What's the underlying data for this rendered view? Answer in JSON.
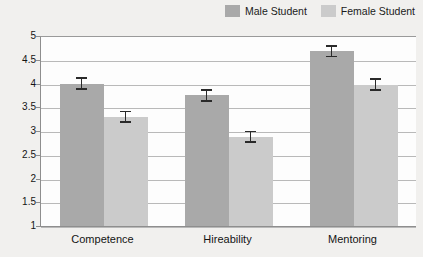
{
  "legend": {
    "position": "top-right",
    "entries": [
      {
        "label": "Male Student",
        "color": "#a9a9a9",
        "swatch_name": "legend-swatch-male"
      },
      {
        "label": "Female Student",
        "color": "#cbcbcb",
        "swatch_name": "legend-swatch-female"
      }
    ]
  },
  "colors": {
    "male_bar": "#a9a9a9",
    "female_bar": "#cbcbcb",
    "gridline": "#b9b9b9",
    "axis": "#8e8e8e",
    "error_bar": "#2a2a2a",
    "page_background": "#f1f0ee",
    "plot_background": "#fdfdfd"
  },
  "axis": {
    "y_ticks": [
      "5",
      "4.5",
      "4",
      "3.5",
      "3",
      "2.5",
      "2",
      "1.5",
      "1"
    ],
    "y_tick_values": [
      5,
      4.5,
      4,
      3.5,
      3,
      2.5,
      2,
      1.5,
      1
    ]
  },
  "chart_data": {
    "type": "bar",
    "title": "",
    "subtitle": "",
    "xlabel": "",
    "ylabel": "",
    "ylim": [
      1,
      5
    ],
    "ytick_step": 0.5,
    "grid": true,
    "legend_position": "top-right",
    "categories": [
      "Competence",
      "Hireability",
      "Mentoring"
    ],
    "series": [
      {
        "name": "Male Student",
        "color": "#a9a9a9",
        "values": [
          4.02,
          3.77,
          4.7
        ],
        "errors": [
          0.13,
          0.13,
          0.13
        ]
      },
      {
        "name": "Female Student",
        "color": "#cbcbcb",
        "values": [
          3.32,
          2.9,
          4.0
        ],
        "errors": [
          0.13,
          0.13,
          0.13
        ]
      }
    ],
    "error_bar_type": "standard-error",
    "annotations": []
  }
}
